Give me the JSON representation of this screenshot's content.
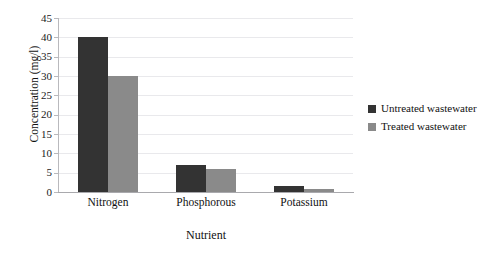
{
  "chart_data": {
    "type": "bar",
    "title": "",
    "subtitle": "",
    "xlabel": "Nutrient",
    "ylabel": "Concentration (mg/l)",
    "categories": [
      "Nitrogen",
      "Phosphorous",
      "Potassium"
    ],
    "series": [
      {
        "name": "Untreated wastewater",
        "color": "#333333",
        "values": [
          40,
          7,
          1.5
        ]
      },
      {
        "name": "Treated wastewater",
        "color": "#8a8a8a",
        "values": [
          30,
          6,
          0.7
        ]
      }
    ],
    "ylim": [
      0,
      45
    ],
    "ytick_step": 5,
    "yticks": [
      45,
      40,
      35,
      30,
      25,
      20,
      15,
      10,
      5,
      0
    ],
    "ytick_labels": [
      "45",
      "40",
      "35",
      "30",
      "25",
      "20",
      "15",
      "10",
      "5",
      "0"
    ],
    "grid": true,
    "grid_axis": "y",
    "legend_position": "right",
    "background_color": "#ffffff",
    "axis_color": "#b9b9bd",
    "grid_color": "#e9e9ec"
  },
  "legend": {
    "entries": [
      {
        "label": "Untreated wastewater"
      },
      {
        "label": "Treated wastewater"
      }
    ]
  }
}
